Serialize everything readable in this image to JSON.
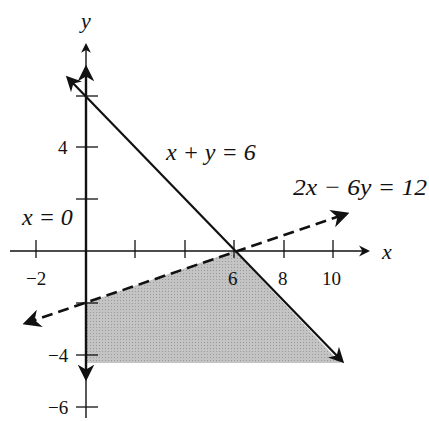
{
  "diagram": {
    "type": "linear-inequality-feasible-region",
    "axes": {
      "x_label": "x",
      "y_label": "y",
      "x_ticks": [
        {
          "value": -2,
          "label": "−2"
        },
        {
          "value": 2,
          "label": ""
        },
        {
          "value": 4,
          "label": ""
        },
        {
          "value": 6,
          "label": "6"
        },
        {
          "value": 8,
          "label": "8"
        },
        {
          "value": 10,
          "label": "10"
        }
      ],
      "y_ticks": [
        {
          "value": 6,
          "label": ""
        },
        {
          "value": 4,
          "label": "4"
        },
        {
          "value": 2,
          "label": ""
        },
        {
          "value": -2,
          "label": ""
        },
        {
          "value": -4,
          "label": "−4"
        },
        {
          "value": -6,
          "label": "−6"
        }
      ]
    },
    "lines": [
      {
        "equation": "x + y = 6",
        "style": "solid"
      },
      {
        "equation": "2x − 6y = 12",
        "style": "dashed"
      },
      {
        "equation": "x = 0",
        "style": "solid"
      }
    ],
    "shaded_region": {
      "description": "region bounded by x = 0, 2x - 6y = 12, x + y = 6, and y = -4",
      "vertices": [
        [
          0,
          -2
        ],
        [
          6,
          0
        ],
        [
          10,
          -4
        ],
        [
          0,
          -4
        ]
      ],
      "color": "#b8b8b8"
    },
    "colors": {
      "ink": "#111111",
      "shade": "#b8b8b8",
      "background": "#ffffff"
    }
  }
}
